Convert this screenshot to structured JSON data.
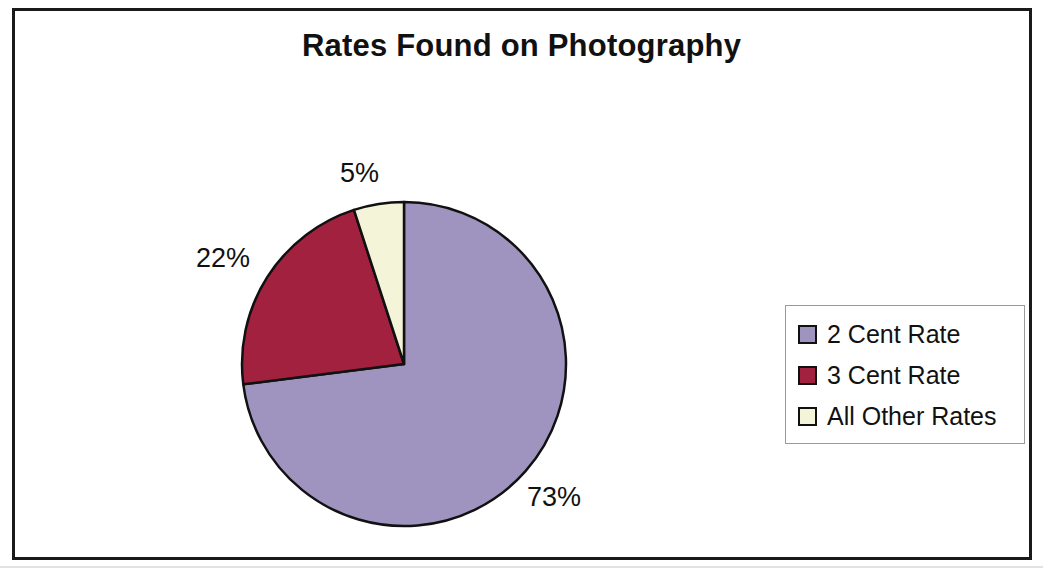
{
  "chart_data": {
    "type": "pie",
    "title": "Rates Found on Photography",
    "categories": [
      "2 Cent Rate",
      "3 Cent Rate",
      "All Other Rates"
    ],
    "values": [
      73,
      22,
      5
    ],
    "value_labels": [
      "73%",
      "22%",
      "5%"
    ],
    "unit": "percent",
    "start_angle_deg": 0,
    "direction": "clockwise",
    "legend_position": "right",
    "grid": false,
    "colors": [
      "#9f94bf",
      "#a2213f",
      "#f4f4d8"
    ],
    "slice_outline_color": "#111111",
    "slices": [
      {
        "label": "2 Cent Rate",
        "value": 73,
        "value_label": "73%",
        "color": "#9f94bf",
        "start_deg": 0,
        "end_deg": 262.8
      },
      {
        "label": "3 Cent Rate",
        "value": 22,
        "value_label": "22%",
        "color": "#a2213f",
        "start_deg": 262.8,
        "end_deg": 342.0
      },
      {
        "label": "All Other Rates",
        "value": 5,
        "value_label": "5%",
        "color": "#f4f4d8",
        "start_deg": 342.0,
        "end_deg": 360.0
      }
    ],
    "xlabel": "",
    "ylabel": ""
  },
  "title": "Rates Found on Photography",
  "labels": {
    "all_other_rates": "5%",
    "three_cent_rate": "22%",
    "two_cent_rate": "73%"
  },
  "legend": {
    "items": [
      {
        "label": "2 Cent Rate",
        "color": "#9f94bf"
      },
      {
        "label": "3 Cent Rate",
        "color": "#a2213f"
      },
      {
        "label": "All Other Rates",
        "color": "#f4f4d8"
      }
    ]
  }
}
